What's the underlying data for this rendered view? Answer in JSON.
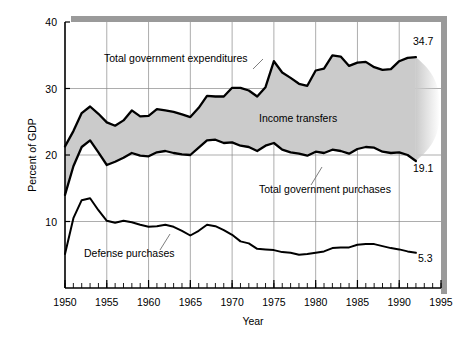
{
  "chart_data": {
    "type": "area",
    "title": "",
    "xlabel": "Year",
    "ylabel": "Percent of GDP",
    "xlim": [
      1950,
      1995
    ],
    "ylim": [
      0,
      40
    ],
    "xticks": [
      1950,
      1955,
      1960,
      1965,
      1970,
      1975,
      1980,
      1985,
      1990,
      1995
    ],
    "yticks": [
      10,
      20,
      30,
      40
    ],
    "grid": true,
    "minor_xtick_interval": 1,
    "legend_position": "inline-annotations",
    "x": [
      1950,
      1951,
      1952,
      1953,
      1954,
      1955,
      1956,
      1957,
      1958,
      1959,
      1960,
      1961,
      1962,
      1963,
      1964,
      1965,
      1966,
      1967,
      1968,
      1969,
      1970,
      1971,
      1972,
      1973,
      1974,
      1975,
      1976,
      1977,
      1978,
      1979,
      1980,
      1981,
      1982,
      1983,
      1984,
      1985,
      1986,
      1987,
      1988,
      1989,
      1990,
      1991,
      1992
    ],
    "series": [
      {
        "name": "Total government expenditures",
        "style": "line-upper",
        "values": [
          21.3,
          23.6,
          26.3,
          27.3,
          26.2,
          24.9,
          24.4,
          25.2,
          26.7,
          25.8,
          25.9,
          26.9,
          26.7,
          26.5,
          26.1,
          25.7,
          27.1,
          28.9,
          28.8,
          28.8,
          30.1,
          30.1,
          29.7,
          28.8,
          30.2,
          34.1,
          32.4,
          31.6,
          30.7,
          30.4,
          32.7,
          33.0,
          35.0,
          34.8,
          33.4,
          33.9,
          34.0,
          33.2,
          32.8,
          32.9,
          34.1,
          34.6,
          34.7
        ],
        "end_label": "34.7"
      },
      {
        "name": "Total government purchases",
        "style": "line-lower",
        "values": [
          14.0,
          18.3,
          21.2,
          22.2,
          20.4,
          18.5,
          19.0,
          19.6,
          20.3,
          19.9,
          19.8,
          20.4,
          20.6,
          20.3,
          20.1,
          20.0,
          21.1,
          22.2,
          22.3,
          21.8,
          21.9,
          21.4,
          21.2,
          20.6,
          21.4,
          21.8,
          20.8,
          20.4,
          20.2,
          19.9,
          20.5,
          20.3,
          20.8,
          20.6,
          20.2,
          20.9,
          21.2,
          21.1,
          20.5,
          20.3,
          20.4,
          20.0,
          19.1
        ],
        "end_label": "19.1"
      },
      {
        "name": "Defense purchases",
        "style": "line-plain",
        "values": [
          5.1,
          10.5,
          13.2,
          13.5,
          11.7,
          10.1,
          9.8,
          10.1,
          9.9,
          9.5,
          9.2,
          9.3,
          9.5,
          9.2,
          8.6,
          7.9,
          8.6,
          9.5,
          9.3,
          8.7,
          8.0,
          7.0,
          6.7,
          5.9,
          5.8,
          5.7,
          5.4,
          5.3,
          5.0,
          5.1,
          5.3,
          5.5,
          6.0,
          6.1,
          6.1,
          6.5,
          6.6,
          6.6,
          6.3,
          6.0,
          5.8,
          5.5,
          5.3
        ],
        "end_label": "5.3"
      }
    ],
    "band": {
      "name": "Income transfers",
      "between": [
        "Total government expenditures",
        "Total government purchases"
      ],
      "fill": "#cccccc"
    },
    "annotations": [
      {
        "text": "Total government expenditures",
        "x": 104,
        "y": 62,
        "leader": true
      },
      {
        "text": "Income transfers",
        "x": 259,
        "y": 122,
        "leader": false
      },
      {
        "text": "Total government purchases",
        "x": 259,
        "y": 193,
        "leader": true
      },
      {
        "text": "Defense purchases",
        "x": 84,
        "y": 257,
        "leader": true
      }
    ],
    "end_labels": [
      {
        "text": "34.7",
        "x": 413,
        "y": 45
      },
      {
        "text": "19.1",
        "x": 413,
        "y": 172
      },
      {
        "text": "5.3",
        "x": 418,
        "y": 262
      }
    ],
    "colors": {
      "band_fill": "#cbcbcb",
      "line": "#000000",
      "grid": "#8a8a8a",
      "axis": "#000000",
      "shadow": "#9a9a9a",
      "background": "#ffffff"
    }
  },
  "axes": {
    "y_title": "Percent of GDP",
    "x_title": "Year",
    "y_tick_labels": [
      "40",
      "30",
      "20",
      "10"
    ],
    "x_tick_labels": [
      "1950",
      "1955",
      "1960",
      "1965",
      "1970",
      "1975",
      "1980",
      "1985",
      "1990",
      "1995"
    ]
  },
  "annotation_labels": {
    "expenditures": "Total government expenditures",
    "income_transfers": "Income transfers",
    "purchases": "Total government purchases",
    "defense": "Defense purchases"
  },
  "end_values": {
    "expenditures": "34.7",
    "purchases": "19.1",
    "defense": "5.3"
  }
}
